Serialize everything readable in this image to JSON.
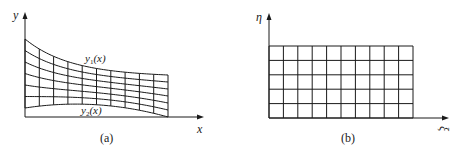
{
  "figure_a": {
    "caption": "(a)",
    "x_axis_label": "x",
    "y_axis_label": "y",
    "upper_curve_label": "y",
    "upper_curve_sub": "1",
    "upper_curve_arg": "(x)",
    "lower_curve_label": "y",
    "lower_curve_sub": "2",
    "lower_curve_arg": "(x)",
    "grid_columns": 10,
    "grid_rows": 6,
    "description": "Curvilinear grid in physical domain bounded by y1(x) above and y2(x) below"
  },
  "figure_b": {
    "caption": "(b)",
    "x_axis_label": "ξ",
    "y_axis_label": "η",
    "grid_columns": 10,
    "grid_rows": 5,
    "description": "Uniform rectangular grid in computational domain"
  },
  "colors": {
    "line": "#1a1a1a",
    "background": "#ffffff"
  }
}
